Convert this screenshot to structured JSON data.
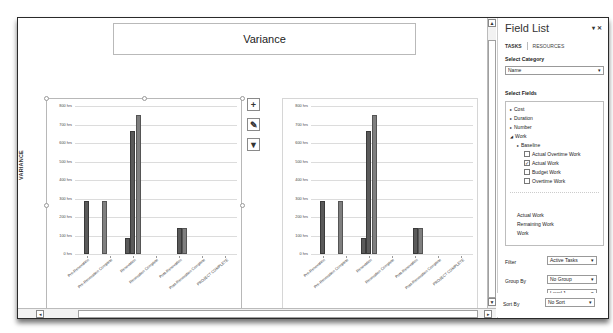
{
  "report": {
    "title": "Variance",
    "side_label": "VARIANCE"
  },
  "chart_buttons": [
    {
      "name": "chart-elements-button",
      "glyph": "+"
    },
    {
      "name": "chart-styles-button",
      "glyph": "✎"
    },
    {
      "name": "chart-filters-button",
      "glyph": "▼"
    }
  ],
  "field_list": {
    "title": "Field List",
    "controls": "▾ ✕",
    "tabs": [
      {
        "label": "TASKS",
        "active": true
      },
      {
        "label": "RESOURCES",
        "active": false
      }
    ],
    "select_category_label": "Select Category",
    "category_value": "Name",
    "select_fields_label": "Select Fields",
    "tree": [
      {
        "label": "Cost",
        "type": "collapsed",
        "level": 0
      },
      {
        "label": "Duration",
        "type": "collapsed",
        "level": 0
      },
      {
        "label": "Number",
        "type": "collapsed",
        "level": 0
      },
      {
        "label": "Work",
        "type": "expanded",
        "level": 0
      },
      {
        "label": "Baseline",
        "type": "collapsed",
        "level": 1
      },
      {
        "label": "Actual Overtime Work",
        "type": "checkbox",
        "checked": false,
        "level": 2
      },
      {
        "label": "Actual Work",
        "type": "checkbox",
        "checked": true,
        "level": 2
      },
      {
        "label": "Budget Work",
        "type": "checkbox",
        "checked": false,
        "level": 2
      },
      {
        "label": "Overtime Work",
        "type": "checkbox",
        "checked": false,
        "level": 2
      }
    ],
    "selected_fields": [
      "Actual Work",
      "Remaining Work",
      "Work"
    ],
    "filter_label": "Filter",
    "filter_value": "Active Tasks",
    "group_by_label": "Group By",
    "group_by_value": "No Group",
    "outline_level_label": "Outline Level",
    "outline_level_value": "Level 1",
    "show_hierarchy_label": "Show Hierarchy",
    "show_hierarchy_checked": false,
    "sort_by_label": "Sort By",
    "sort_by_value": "No Sort"
  },
  "colors": {
    "series_dark": "#5a5a5a",
    "series_medium": "#7f7f7f",
    "gridline": "#dcdcdc"
  },
  "chart_data": [
    {
      "type": "bar",
      "title": "",
      "xlabel": "",
      "ylabel": "",
      "ylim": [
        0,
        800
      ],
      "y_ticks": [
        "0 hrs",
        "100 hrs",
        "200 hrs",
        "300 hrs",
        "400 hrs",
        "500 hrs",
        "600 hrs",
        "700 hrs",
        "800 hrs"
      ],
      "grid": true,
      "categories": [
        "Pre-Renovation",
        "Pre-Renovation Complete",
        "Renovation",
        "Renovation Complete",
        "Post-Renovation",
        "Post-Renovation Complete",
        "PROJECT COMPLETE"
      ],
      "bars": [
        {
          "category": 0,
          "offset": 0,
          "value": 285,
          "series": "s1"
        },
        {
          "category": 1,
          "offset": -1,
          "value": 285,
          "series": "s2"
        },
        {
          "category": 2,
          "offset": -1,
          "value": 88,
          "series": "s1"
        },
        {
          "category": 2,
          "offset": 0,
          "value": 665,
          "series": "s1"
        },
        {
          "category": 2,
          "offset": 1,
          "value": 750,
          "series": "s2"
        },
        {
          "category": 4,
          "offset": 0,
          "value": 140,
          "series": "s1"
        },
        {
          "category": 4,
          "offset": 1,
          "value": 140,
          "series": "s2"
        }
      ]
    },
    {
      "type": "bar",
      "title": "",
      "xlabel": "",
      "ylabel": "",
      "ylim": [
        0,
        800
      ],
      "y_ticks": [
        "0 hrs",
        "100 hrs",
        "200 hrs",
        "300 hrs",
        "400 hrs",
        "500 hrs",
        "600 hrs",
        "700 hrs",
        "800 hrs"
      ],
      "grid": true,
      "categories": [
        "Pre-Renovation",
        "Pre-Renovation Complete",
        "Renovation",
        "Renovation Complete",
        "Post-Renovation",
        "Post-Renovation Complete",
        "PROJECT COMPLETE"
      ],
      "bars": [
        {
          "category": 0,
          "offset": 0,
          "value": 285,
          "series": "s1"
        },
        {
          "category": 1,
          "offset": -1,
          "value": 285,
          "series": "s2"
        },
        {
          "category": 2,
          "offset": -1,
          "value": 88,
          "series": "s1"
        },
        {
          "category": 2,
          "offset": 0,
          "value": 665,
          "series": "s1"
        },
        {
          "category": 2,
          "offset": 1,
          "value": 750,
          "series": "s2"
        },
        {
          "category": 4,
          "offset": 0,
          "value": 140,
          "series": "s1"
        },
        {
          "category": 4,
          "offset": 1,
          "value": 140,
          "series": "s2"
        }
      ]
    }
  ]
}
